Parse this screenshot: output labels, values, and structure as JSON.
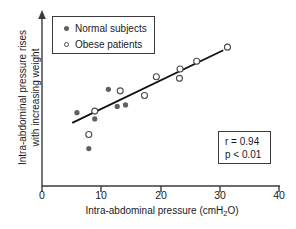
{
  "chart_data": {
    "type": "scatter",
    "title": "",
    "xlabel": "Intra-abdominal pressure (cmH2O)",
    "xlabel_prefix": "Intra-abdominal pressure (cmH",
    "xlabel_sub": "2",
    "xlabel_suffix": "O)",
    "ylabel_line1": "Intra-abdominal pressure rises",
    "ylabel_line2": "with increasing weight",
    "xlim": [
      0,
      40
    ],
    "ylim": [
      0,
      100
    ],
    "x_ticks": [
      "0",
      "10",
      "20",
      "30",
      "40"
    ],
    "x_tick_values": [
      0,
      10,
      20,
      30,
      40
    ],
    "y_ticks": [],
    "grid": false,
    "y_axis_arrow": true,
    "legend_position": "top-left",
    "series": [
      {
        "name": "Normal subjects",
        "marker": "filled-circle",
        "color": "#606060",
        "points": [
          {
            "x": 5.9,
            "y": 47.0
          },
          {
            "x": 7.9,
            "y": 24.0
          },
          {
            "x": 8.9,
            "y": 43.0
          },
          {
            "x": 11.2,
            "y": 62.0
          },
          {
            "x": 12.7,
            "y": 51.0
          },
          {
            "x": 14.1,
            "y": 52.0
          }
        ]
      },
      {
        "name": "Obese patients",
        "marker": "open-circle",
        "color": "#4a4a4a",
        "points": [
          {
            "x": 7.9,
            "y": 33.0
          },
          {
            "x": 8.9,
            "y": 48.0
          },
          {
            "x": 13.2,
            "y": 61.0
          },
          {
            "x": 17.3,
            "y": 58.0
          },
          {
            "x": 19.3,
            "y": 70.0
          },
          {
            "x": 23.2,
            "y": 69.0
          },
          {
            "x": 23.3,
            "y": 75.0
          },
          {
            "x": 26.1,
            "y": 80.0
          },
          {
            "x": 31.3,
            "y": 89.0
          }
        ]
      }
    ],
    "regression_line": {
      "x_start": 5.1,
      "y_start": 40.5,
      "x_end": 30.6,
      "y_end": 87.0
    },
    "annotations": {
      "r_label": "r = 0.94",
      "p_label": "p < 0.01",
      "r_value": 0.94,
      "p_value": "< 0.01"
    }
  },
  "legend": {
    "items": [
      {
        "label": "Normal subjects",
        "marker": "filled-circle"
      },
      {
        "label": "Obese patients",
        "marker": "open-circle"
      }
    ]
  },
  "colors": {
    "background": "#ffffff",
    "axis": "#3a3a3a",
    "line": "#111111",
    "filled_marker": "#606060",
    "open_marker": "#4a4a4a",
    "text": "#1a1a1a"
  }
}
